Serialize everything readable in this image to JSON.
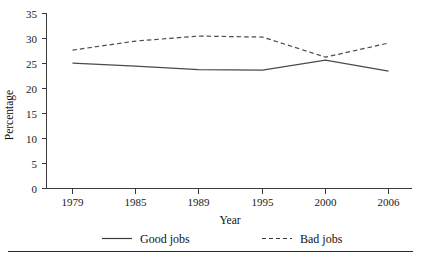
{
  "chart_data": {
    "type": "line",
    "title": "",
    "xlabel": "Year",
    "ylabel": "Percentage",
    "categories": [
      "1979",
      "1985",
      "1989",
      "1995",
      "2000",
      "2006"
    ],
    "x": [
      1979,
      1985,
      1989,
      1995,
      2000,
      2006
    ],
    "ylim": [
      0,
      35
    ],
    "yticks": [
      0,
      5,
      10,
      15,
      20,
      25,
      30,
      35
    ],
    "ytick_labels": [
      "0",
      "5",
      "10",
      "15",
      "20",
      "25",
      "30",
      "35"
    ],
    "grid": false,
    "legend_position": "bottom",
    "series": [
      {
        "name": "Good jobs",
        "style": "solid",
        "color": "#4a4a4a",
        "values": [
          25.0,
          24.4,
          23.7,
          23.6,
          25.6,
          23.4
        ]
      },
      {
        "name": "Bad jobs",
        "style": "dashed",
        "color": "#4a4a4a",
        "values": [
          27.6,
          29.4,
          30.4,
          30.2,
          26.2,
          29.0
        ]
      }
    ]
  },
  "axes": {
    "y_title": "Percentage",
    "x_title": "Year"
  },
  "legend": {
    "items": [
      {
        "label": "Good jobs",
        "style": "solid"
      },
      {
        "label": "Bad jobs",
        "style": "dashed"
      }
    ]
  }
}
